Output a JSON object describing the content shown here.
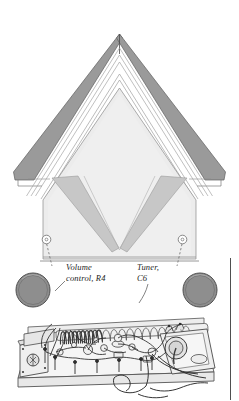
{
  "figure": {
    "kind": "technical-line-illustration",
    "background_color": "#ffffff",
    "ink_color": "#2b2b2b",
    "roof_fill": "#9c9c9c",
    "face_fill": "#ececec",
    "panel_fill": "#e3e3e3",
    "wedge_fill": "#c9c9c9",
    "knob_fill": "#8e8e8e",
    "board_fill": "#f3f3f3",
    "rule_color": "#555555"
  },
  "callouts": [
    {
      "id": "volume",
      "line1": "Volume",
      "line2": "control, R4",
      "marker": "callout-dot",
      "target": "left-knob"
    },
    {
      "id": "tuner",
      "line1": "Tuner,",
      "line2": "C6",
      "marker": "callout-dot",
      "target": "right-knob"
    }
  ],
  "parts": {
    "left_knob": "Volume control, R4",
    "right_knob": "Tuner, C6",
    "coil": "tuning coil",
    "speaker": "speaker",
    "chassis": "chassis base board"
  }
}
